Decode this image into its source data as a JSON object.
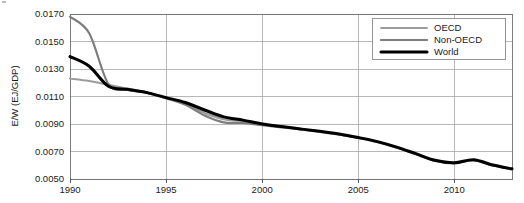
{
  "chart_data": {
    "type": "line",
    "title": "",
    "xlabel": "",
    "ylabel": "E/W (EJ/GDP)",
    "xlim": [
      1990,
      2013
    ],
    "ylim": [
      0.005,
      0.017
    ],
    "grid": true,
    "legend_position": "top-right",
    "x_ticks": [
      "1990",
      "1995",
      "2000",
      "2005",
      "2010"
    ],
    "x_tick_values": [
      1990,
      1995,
      2000,
      2005,
      2010
    ],
    "y_ticks": [
      "0.0050",
      "0.0070",
      "0.0090",
      "0.0110",
      "0.0130",
      "0.0150",
      "0.0170"
    ],
    "y_tick_values": [
      0.005,
      0.007,
      0.009,
      0.011,
      0.013,
      0.015,
      0.017
    ],
    "x": [
      1990,
      1991,
      1992,
      1993,
      1994,
      1995,
      1996,
      1997,
      1998,
      1999,
      2000,
      2001,
      2002,
      2003,
      2004,
      2005,
      2006,
      2007,
      2008,
      2009,
      2010,
      2011,
      2012,
      2013
    ],
    "series": [
      {
        "name": "OECD",
        "color": "#9c9c9c",
        "width": 2.0,
        "values": [
          0.0123,
          0.01212,
          0.01185,
          0.01157,
          0.0113,
          0.01086,
          0.01048,
          0.0098,
          0.00935,
          0.0092,
          0.00898,
          0.0088,
          0.00862,
          0.00845,
          0.00826,
          0.008,
          0.0077,
          0.0073,
          0.00682,
          0.00634,
          0.00616,
          0.00638,
          0.006,
          0.00572
        ]
      },
      {
        "name": "Non-OECD",
        "color": "#7d7d7d",
        "width": 2.2,
        "values": [
          0.0168,
          0.0156,
          0.0119,
          0.01148,
          0.01126,
          0.01088,
          0.0104,
          0.00962,
          0.00912,
          0.00908,
          0.00892,
          0.00876,
          0.0086,
          0.00843,
          0.00824,
          0.00798,
          0.00768,
          0.00728,
          0.0068,
          0.00632,
          0.00614,
          0.00636,
          0.00598,
          0.0057
        ]
      },
      {
        "name": "World",
        "color": "#000000",
        "width": 3.0,
        "values": [
          0.0139,
          0.0132,
          0.01175,
          0.01152,
          0.01128,
          0.01092,
          0.01056,
          0.01002,
          0.00952,
          0.00928,
          0.009,
          0.00882,
          0.00864,
          0.00847,
          0.00828,
          0.00802,
          0.00772,
          0.00732,
          0.00684,
          0.00636,
          0.00618,
          0.0064,
          0.00602,
          0.00574
        ]
      }
    ]
  },
  "legend": {
    "entries": [
      {
        "label": "OECD"
      },
      {
        "label": "Non-OECD"
      },
      {
        "label": "World"
      }
    ]
  }
}
